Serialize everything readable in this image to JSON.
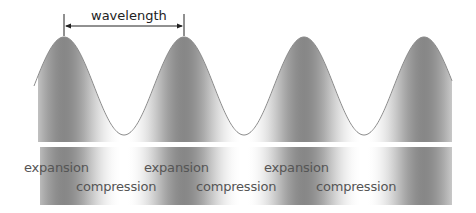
{
  "diagram": {
    "title_annotation": "wavelength",
    "wavelength_px": 120,
    "peaks_x": [
      64,
      184,
      303,
      423
    ],
    "colors": {
      "dark": "#8a8a8a",
      "light": "#ffffff",
      "curve": "#8c8c8c",
      "text": "#555555",
      "arrow": "#222222"
    },
    "bands": [
      {
        "name": "wave-band",
        "y_top": 37,
        "y_bottom": 142
      },
      {
        "name": "density-band",
        "y_top": 147,
        "y_bottom": 205
      }
    ],
    "labels": [
      {
        "text": "expansion",
        "x": 24,
        "y": 160
      },
      {
        "text": "compression",
        "x": 76,
        "y": 179
      },
      {
        "text": "expansion",
        "x": 144,
        "y": 160
      },
      {
        "text": "compression",
        "x": 196,
        "y": 179
      },
      {
        "text": "expansion",
        "x": 264,
        "y": 160
      },
      {
        "text": "compression",
        "x": 316,
        "y": 179
      }
    ]
  }
}
